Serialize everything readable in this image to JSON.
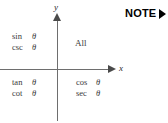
{
  "figure": {
    "type": "trig-sign-quadrant-diagram",
    "axes": {
      "x_label": "x",
      "y_label": "y"
    },
    "quadrants": {
      "q1": {
        "name": "quadrant-one",
        "rows": [
          {
            "function": "All",
            "argument": ""
          }
        ]
      },
      "q2": {
        "name": "quadrant-two",
        "rows": [
          {
            "function": "sin",
            "argument": "θ"
          },
          {
            "function": "csc",
            "argument": "θ"
          }
        ]
      },
      "q3": {
        "name": "quadrant-three",
        "rows": [
          {
            "function": "tan",
            "argument": "θ"
          },
          {
            "function": "cot",
            "argument": "θ"
          }
        ]
      },
      "q4": {
        "name": "quadrant-four",
        "rows": [
          {
            "function": "cos",
            "argument": "θ"
          },
          {
            "function": "sec",
            "argument": "θ"
          }
        ]
      }
    }
  },
  "note": {
    "label": "NOTE",
    "arrow_icon": "triangle-right-icon"
  },
  "colors": {
    "background": "#ffffff",
    "axis": "#6e6e6e",
    "axis_head": "#4a4a4a",
    "text": "#3a3a3a",
    "note_text": "#000000"
  }
}
